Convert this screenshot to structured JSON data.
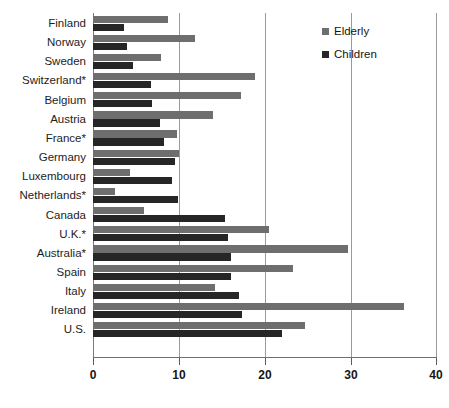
{
  "chart_data": {
    "type": "bar",
    "orientation": "horizontal",
    "title": "",
    "subtitle": "",
    "xlabel": "",
    "ylabel": "",
    "xlim": [
      0,
      40
    ],
    "xticks": [
      0,
      10,
      20,
      30,
      40
    ],
    "xtick_labels": [
      "0",
      "10",
      "20",
      "30",
      "40"
    ],
    "grid": true,
    "grid_axis": "x",
    "legend_position": "top-right",
    "categories": [
      "Finland",
      "Norway",
      "Sweden",
      "Switzerland*",
      "Belgium",
      "Austria",
      "France*",
      "Germany",
      "Luxembourg",
      "Netherlands*",
      "Canada",
      "U.K.*",
      "Australia*",
      "Spain",
      "Italy",
      "Ireland",
      "U.S."
    ],
    "series": [
      {
        "name": "Elderly",
        "color": "#6e6e6e",
        "values": [
          8.7,
          11.9,
          7.9,
          18.8,
          17.2,
          14.0,
          9.8,
          10.0,
          4.3,
          2.6,
          5.9,
          20.5,
          29.7,
          23.3,
          14.2,
          36.2,
          24.7
        ]
      },
      {
        "name": "Children",
        "color": "#262626",
        "values": [
          3.6,
          3.9,
          4.6,
          6.7,
          6.9,
          7.8,
          8.3,
          9.5,
          9.2,
          9.9,
          15.3,
          15.7,
          16.0,
          16.1,
          17.0,
          17.3,
          22.0
        ]
      }
    ]
  },
  "legend": {
    "items": [
      {
        "label": "Elderly",
        "color": "#6e6e6e"
      },
      {
        "label": "Children",
        "color": "#262626"
      }
    ]
  },
  "axis": {
    "tick_labels": [
      "0",
      "10",
      "20",
      "30",
      "40"
    ]
  }
}
